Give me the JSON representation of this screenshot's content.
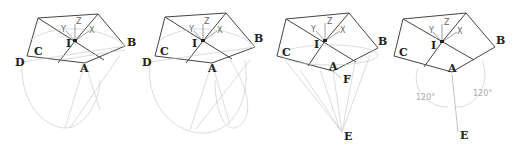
{
  "panels": [
    {
      "id": "panel-1",
      "labels": {
        "A": "A",
        "B": "B",
        "C": "C",
        "D": "D",
        "I": "I"
      }
    },
    {
      "id": "panel-2",
      "labels": {
        "A": "A",
        "B": "B",
        "C": "C",
        "D": "D",
        "I": "I"
      }
    },
    {
      "id": "panel-3",
      "labels": {
        "A": "A",
        "B": "B",
        "C": "C",
        "E": "E",
        "F": "F",
        "I": "I"
      }
    },
    {
      "id": "panel-4",
      "labels": {
        "A": "A",
        "B": "B",
        "C": "C",
        "E": "E",
        "I": "I"
      },
      "angles": [
        "120°",
        "120°"
      ]
    }
  ],
  "axes": {
    "x": "X",
    "y": "Y",
    "z": "Z"
  }
}
